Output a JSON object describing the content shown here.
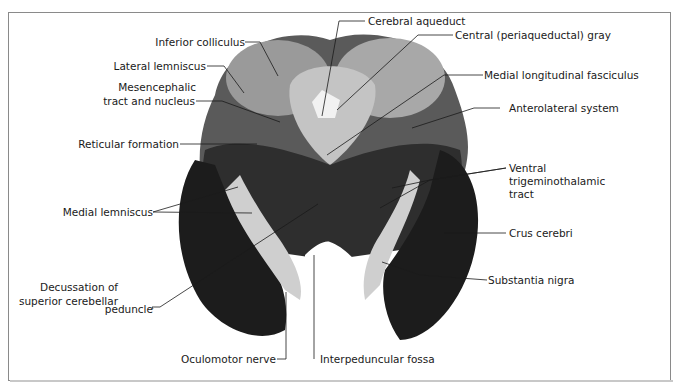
{
  "figure": {
    "labels": {
      "inferior_colliculus": "Inferior colliculus",
      "lateral_lemniscus": "Lateral lemniscus",
      "mesencephalic_1": "Mesencephalic",
      "mesencephalic_2": "tract and nucleus",
      "reticular_formation": "Reticular formation",
      "medial_lemniscus": "Medial lemniscus",
      "decussation_1": "Decussation of",
      "decussation_2": "superior cerebellar",
      "decussation_3": "peduncle",
      "oculomotor_nerve": "Oculomotor nerve",
      "interpeduncular_fossa": "Interpeduncular fossa",
      "cerebral_aqueduct": "Cerebral aqueduct",
      "central_gray": "Central (periaqueductal) gray",
      "mlf": "Medial longitudinal fasciculus",
      "anterolateral_system": "Anterolateral system",
      "vtt_1": "Ventral",
      "vtt_2": "trigeminothalamic",
      "vtt_3": "tract",
      "crus_cerebri": "Crus cerebri",
      "substantia_nigra": "Substantia nigra"
    },
    "colors": {
      "border": "#8a8a8a",
      "tissue_dark": "#1c1c1c",
      "tissue_mid": "#6e6e6e",
      "tissue_light": "#c9c9c9",
      "leader_line": "#1a1a1a"
    }
  }
}
